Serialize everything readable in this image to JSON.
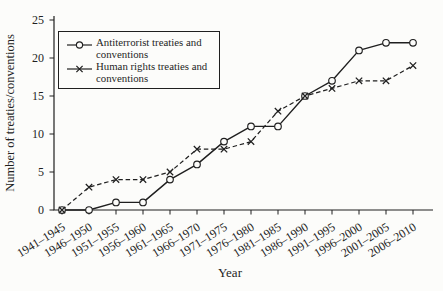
{
  "colors": {
    "ink": "#1f1f1f",
    "background": "#fcfcfa"
  },
  "chart_data": {
    "type": "line",
    "title": "",
    "xlabel": "Year",
    "ylabel": "Number of treaties/conventions",
    "ylim": [
      0,
      25
    ],
    "yticks": [
      0,
      5,
      10,
      15,
      20,
      25
    ],
    "grid": false,
    "legend_position": "upper left inside",
    "categories": [
      "1941–1945",
      "1946–1950",
      "1951–1955",
      "1956–1960",
      "1961–1965",
      "1966–1970",
      "1971–1975",
      "1976–1980",
      "1981–1985",
      "1986–1990",
      "1991–1995",
      "1996–2000",
      "2001–2005",
      "2006–2010"
    ],
    "series": [
      {
        "name": "Antiterrorist treaties and conventions",
        "marker": "circle",
        "line_style": "solid",
        "values": [
          0,
          0,
          1,
          1,
          4,
          6,
          9,
          11,
          11,
          15,
          17,
          21,
          22,
          22
        ]
      },
      {
        "name": "Human rights treaties and conventions",
        "marker": "x",
        "line_style": "dashed",
        "values": [
          0,
          3,
          4,
          4,
          5,
          8,
          8,
          9,
          13,
          15,
          16,
          17,
          17,
          19
        ]
      }
    ]
  },
  "legend": {
    "items": [
      {
        "label": "Antiterrorist treaties and\nconventions",
        "marker": "circle"
      },
      {
        "label": "Human rights treaties and\nconventions",
        "marker": "x"
      }
    ]
  }
}
